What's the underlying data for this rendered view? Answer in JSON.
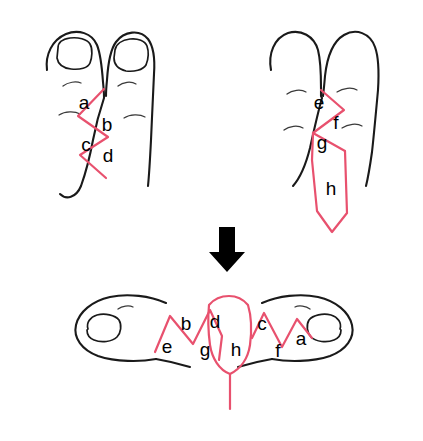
{
  "figure": {
    "background_color": "#ffffff",
    "incision_color": "#e8516e",
    "outline_color": "#1a1a1a",
    "label_color": "#000000"
  },
  "panels": {
    "top_left": {
      "name": "dorsal-view",
      "caption": "",
      "labels": [
        {
          "text": "a",
          "x": 84,
          "y": 104
        },
        {
          "text": "b",
          "x": 107,
          "y": 126
        },
        {
          "text": "c",
          "x": 86,
          "y": 146
        },
        {
          "text": "d",
          "x": 108,
          "y": 157
        }
      ]
    },
    "top_right": {
      "name": "plantar-view",
      "caption": "",
      "labels": [
        {
          "text": "e",
          "x": 319,
          "y": 104
        },
        {
          "text": "f",
          "x": 336,
          "y": 124
        },
        {
          "text": "g",
          "x": 322,
          "y": 144
        },
        {
          "text": "h",
          "x": 331,
          "y": 190
        }
      ]
    },
    "bottom": {
      "name": "separated-toes-result",
      "caption": "",
      "labels": [
        {
          "text": "e",
          "x": 167,
          "y": 348
        },
        {
          "text": "b",
          "x": 186,
          "y": 325
        },
        {
          "text": "d",
          "x": 215,
          "y": 323
        },
        {
          "text": "g",
          "x": 205,
          "y": 351
        },
        {
          "text": "h",
          "x": 236,
          "y": 351
        },
        {
          "text": "c",
          "x": 262,
          "y": 325
        },
        {
          "text": "f",
          "x": 278,
          "y": 352
        },
        {
          "text": "a",
          "x": 301,
          "y": 340
        }
      ]
    }
  },
  "arrow": {
    "name": "downward-arrow",
    "direction": "down",
    "color": "#000000"
  }
}
